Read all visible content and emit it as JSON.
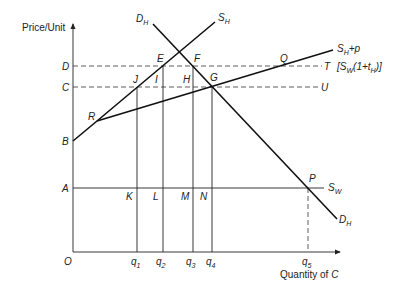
{
  "axes": {
    "y_title": "Price/Unit",
    "x_title_prefix": "Quantity of ",
    "x_title_var": "C",
    "origin": "O"
  },
  "price_levels": {
    "D": "D",
    "C": "C",
    "B": "B",
    "A": "A"
  },
  "quantities": {
    "q1": {
      "base": "q",
      "sub": "1"
    },
    "q2": {
      "base": "q",
      "sub": "2"
    },
    "q3": {
      "base": "q",
      "sub": "3"
    },
    "q4": {
      "base": "q",
      "sub": "4"
    },
    "q5": {
      "base": "q",
      "sub": "5"
    }
  },
  "points": {
    "E": "E",
    "F": "F",
    "G": "G",
    "H": "H",
    "I": "I",
    "J": "J",
    "K": "K",
    "L": "L",
    "M": "M",
    "N": "N",
    "P": "P",
    "Q": "Q",
    "R": "R",
    "T": "T",
    "U": "U"
  },
  "curves": {
    "demand": {
      "base": "D",
      "sub": "H"
    },
    "supply": {
      "base": "S",
      "sub": "H"
    },
    "supply_plus_p": {
      "base": "S",
      "sub": "H",
      "suffix": "+p"
    },
    "world_supply": {
      "base": "S",
      "sub": "W"
    },
    "tariff_label": {
      "open": "[S",
      "sub1": "W",
      "mid": "(1+t",
      "sub2": "H",
      "close": ")]"
    }
  }
}
